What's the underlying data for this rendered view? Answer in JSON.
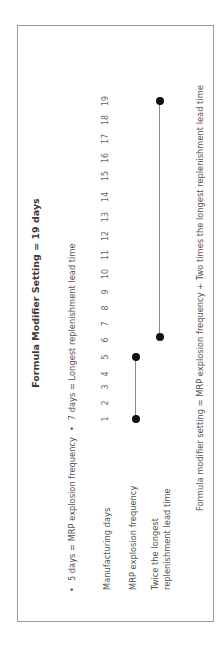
{
  "title": "Formula Modifier Setting = 19 days",
  "bullets": [
    "5 days = MRP explosion frequency",
    "7 days = Longest replenishment lead time"
  ],
  "rows": {
    "manufacturing_days": "Manufacturing days",
    "mrp_explosion_frequency": "MRP explosion frequency",
    "twice_longest_line1": "Twice the longest",
    "twice_longest_line2": "replenishment lead time"
  },
  "days": [
    "1",
    "2",
    "3",
    "4",
    "5",
    "6",
    "7",
    "8",
    "9",
    "10",
    "11",
    "12",
    "13",
    "14",
    "15",
    "16",
    "17",
    "18",
    "19"
  ],
  "caption": "Formula modifier setting = MRP explosion frequency + Two times the longest replenishment lead time",
  "timeline": {
    "mrp_explosion_frequency": {
      "start_day": 1,
      "end_day": 5
    },
    "twice_longest_lead_time": {
      "start_day": 6,
      "end_day": 19
    }
  },
  "colors": {
    "border": "#9a9a9a",
    "dot": "#111111",
    "line": "#8a8a8a",
    "text": "#555555"
  }
}
